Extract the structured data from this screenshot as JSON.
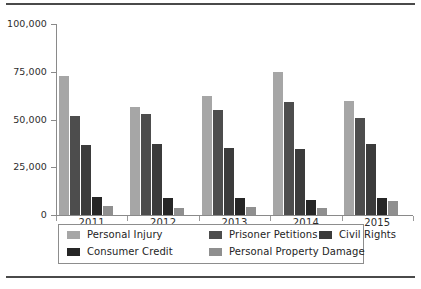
{
  "chart_data": {
    "type": "bar",
    "title": "",
    "subtitle": "",
    "xlabel": "",
    "ylabel": "",
    "grid": false,
    "legend_position": "bottom",
    "categories": [
      "2011",
      "2012",
      "2013",
      "2014",
      "2015"
    ],
    "ylim": [
      0,
      100000
    ],
    "yticks": [
      0,
      25000,
      50000,
      75000,
      100000
    ],
    "ytick_labels": [
      "0",
      "25,000",
      "50,000",
      "75,000",
      "100,000"
    ],
    "series": [
      {
        "name": "Personal Injury",
        "color": "#a6a6a6",
        "values": [
          73000,
          56500,
          62500,
          75000,
          59500
        ]
      },
      {
        "name": "Prisoner Petitions",
        "color": "#4d4d4d",
        "values": [
          52000,
          53000,
          55000,
          59000,
          51000
        ]
      },
      {
        "name": "Civil Rights",
        "color": "#3b3b3b",
        "values": [
          36500,
          37000,
          35000,
          34500,
          37000
        ]
      },
      {
        "name": "Consumer Credit",
        "color": "#262626",
        "values": [
          9500,
          9000,
          9000,
          8000,
          9000
        ]
      },
      {
        "name": "Personal Property Damage",
        "color": "#8f8f8f",
        "values": [
          4500,
          3500,
          4000,
          3500,
          7500
        ]
      }
    ]
  },
  "legend": {
    "rows": [
      [
        {
          "label": "Personal Injury",
          "color": "#a6a6a6"
        },
        {
          "label": "Prisoner Petitions",
          "color": "#4d4d4d"
        },
        {
          "label": "Civil Rights",
          "color": "#3b3b3b"
        }
      ],
      [
        {
          "label": "Consumer Credit",
          "color": "#262626"
        },
        {
          "label": "Personal Property Damage",
          "color": "#8f8f8f"
        }
      ]
    ]
  },
  "style": {
    "axis_color": "#8a8a8a",
    "rule_color": "#4a4a4a",
    "text_color": "#2d2d2d",
    "background": "#ffffff"
  }
}
